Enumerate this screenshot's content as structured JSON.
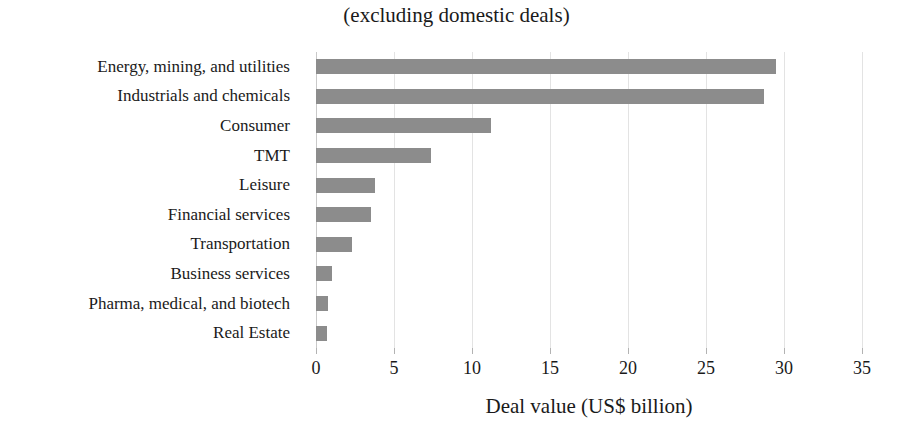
{
  "chart_data": {
    "type": "bar",
    "orientation": "horizontal",
    "title": "(excluding domestic deals)",
    "subtitle": "",
    "xlabel": "Deal value (US$ billion)",
    "ylabel": "",
    "xlim": [
      0,
      35
    ],
    "xticks": [
      0,
      5,
      10,
      15,
      20,
      25,
      30,
      35
    ],
    "xtick_labels": [
      "0",
      "5",
      "10",
      "15",
      "20",
      "25",
      "30",
      "35"
    ],
    "grid": true,
    "grid_axis": "x",
    "legend": false,
    "legend_position": "none",
    "bar_color": "#8c8c8c",
    "gridline_color": "#e3e3e3",
    "background_color": "#ffffff",
    "categories": [
      "Energy, mining, and utilities",
      "Industrials and chemicals",
      "Consumer",
      "TMT",
      "Leisure",
      "Financial services",
      "Transportation",
      "Business services",
      "Pharma, medical, and biotech",
      "Real Estate"
    ],
    "values": [
      29.5,
      28.7,
      11.2,
      7.4,
      3.8,
      3.5,
      2.3,
      1.0,
      0.8,
      0.7
    ]
  }
}
